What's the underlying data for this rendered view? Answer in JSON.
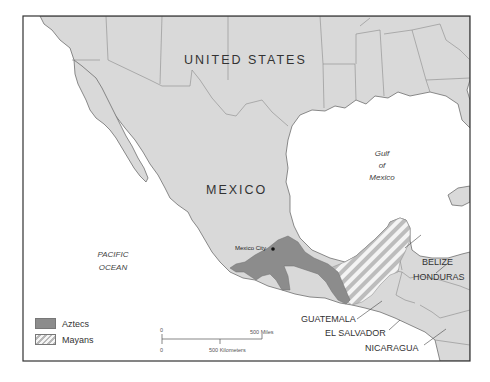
{
  "map": {
    "title": "",
    "labels": {
      "united_states": "UNITED STATES",
      "mexico": "MEXICO",
      "gulf": [
        "Gulf",
        "of",
        "Mexico"
      ],
      "pacific": [
        "PACIFIC",
        "OCEAN"
      ],
      "mexico_city": "Mexico City",
      "belize": "BELIZE",
      "honduras": "HONDURAS",
      "guatemala": "GUATEMALA",
      "el_salvador": "EL SALVADOR",
      "nicaragua": "NICARAGUA"
    },
    "legend": [
      {
        "label": "Aztecs",
        "pattern": "solid",
        "color": "#8c8c8c"
      },
      {
        "label": "Mayans",
        "pattern": "hatched",
        "color": "#b8b8b8"
      }
    ],
    "scale": {
      "top_zero": "0",
      "top_end": "500 Miles",
      "bottom_zero": "0",
      "bottom_mid": "500 Kilometers"
    },
    "colors": {
      "land": "#d9d9d9",
      "water": "#ffffff",
      "border": "#6e6e6e",
      "aztec": "#8c8c8c",
      "frame": "#333333"
    }
  }
}
